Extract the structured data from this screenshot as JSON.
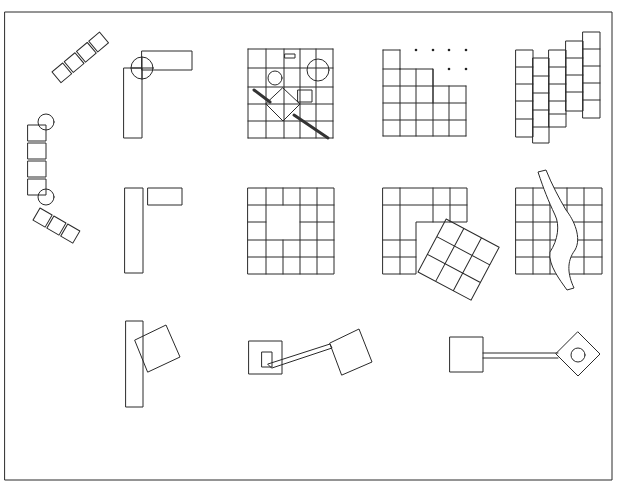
{
  "diagram": {
    "title": "",
    "kind": "architectural spatial relationship sketches",
    "frame": {
      "x": 5,
      "y": 12,
      "width": 607,
      "height": 468
    },
    "stroke_color": "#2a2a2a",
    "background": "#ffffff",
    "figures": [
      {
        "id": "curved-chain",
        "row": 1,
        "col": 0,
        "description": "chain of squares bending around two circle pivots"
      },
      {
        "id": "l-shape-circle",
        "row": 1,
        "col": 1,
        "description": "L-shape of two rectangles joined by circle with cross"
      },
      {
        "id": "grid-with-objects",
        "row": 1,
        "col": 2,
        "description": "5x5 grid with circles, rotated square, small square, diagonal bars"
      },
      {
        "id": "grid-dissolving",
        "row": 1,
        "col": 3,
        "description": "grid with top-right cells reduced to dots"
      },
      {
        "id": "grid-staggered",
        "row": 1,
        "col": 4,
        "description": "stepped columns of grid shifted vertically"
      },
      {
        "id": "l-shape-separated",
        "row": 2,
        "col": 1,
        "description": "vertical rectangle beside detached horizontal rectangle"
      },
      {
        "id": "grid-void",
        "row": 2,
        "col": 2,
        "description": "5x5 grid with 2x2 void"
      },
      {
        "id": "grid-rotated-insert",
        "row": 2,
        "col": 3,
        "description": "L grid with rotated 3x3 grid"
      },
      {
        "id": "grid-river",
        "row": 2,
        "col": 4,
        "description": "5x5 grid cut by meandering river"
      },
      {
        "id": "bar-rotated-square",
        "row": 3,
        "col": 1,
        "description": "vertical bar with overlapping rotated square"
      },
      {
        "id": "linked-squares",
        "row": 3,
        "col": 2,
        "description": "square with nested small square linked to rotated square"
      },
      {
        "id": "square-diamond-link",
        "row": 3,
        "col": 3,
        "description": "square linked by corridor to diamond containing circle"
      }
    ]
  }
}
